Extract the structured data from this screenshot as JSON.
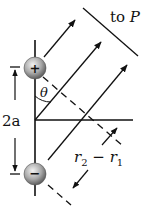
{
  "diagram": {
    "labels": {
      "to_p_prefix": "to ",
      "to_p_var": "P",
      "theta": "θ",
      "separation": "2a",
      "path_diff_r2": "r",
      "path_diff_sub2": "2",
      "path_diff_minus": " − ",
      "path_diff_r1": "r",
      "path_diff_sub1": "1"
    },
    "charges": [
      {
        "sign": "+",
        "symbol": "+",
        "position": "top"
      },
      {
        "sign": "-",
        "symbol": "−",
        "position": "bottom"
      }
    ],
    "colors": {
      "line": "#111111",
      "charge_fill_light": "#eeeeee",
      "charge_fill_dark": "#6a6a6a"
    }
  }
}
